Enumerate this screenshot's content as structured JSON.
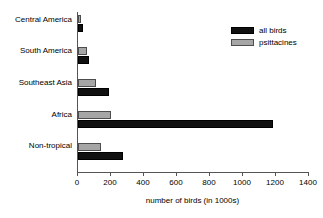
{
  "chart_data": {
    "type": "bar",
    "orientation": "horizontal",
    "title": "",
    "xlabel": "number of birds (in 1000s)",
    "ylabel": "",
    "xlim": [
      0,
      1400
    ],
    "xticks": [
      0,
      200,
      400,
      600,
      800,
      1000,
      1200,
      1400
    ],
    "grid": false,
    "legend_position": "top-right",
    "categories": [
      "Central America",
      "South America",
      "Southeast Asia",
      "Africa",
      "Non-tropical"
    ],
    "series": [
      {
        "name": "all birds",
        "color": "#111111",
        "values": [
          30,
          65,
          190,
          1180,
          270
        ]
      },
      {
        "name": "psittacines",
        "color": "#a6a6a6",
        "values": [
          20,
          55,
          110,
          200,
          140
        ]
      }
    ]
  },
  "axis": {
    "tick_labels": [
      "0",
      "200",
      "400",
      "600",
      "800",
      "1000",
      "1200",
      "1400"
    ],
    "title": "number of birds (in 1000s)"
  },
  "legend": {
    "entries": [
      {
        "label": "all birds",
        "swatch": "black-swatch"
      },
      {
        "label": "psittacines",
        "swatch": "gray-swatch"
      }
    ]
  },
  "category_labels": [
    "Central America",
    "South America",
    "Southeast Asia",
    "Africa",
    "Non-tropical"
  ]
}
